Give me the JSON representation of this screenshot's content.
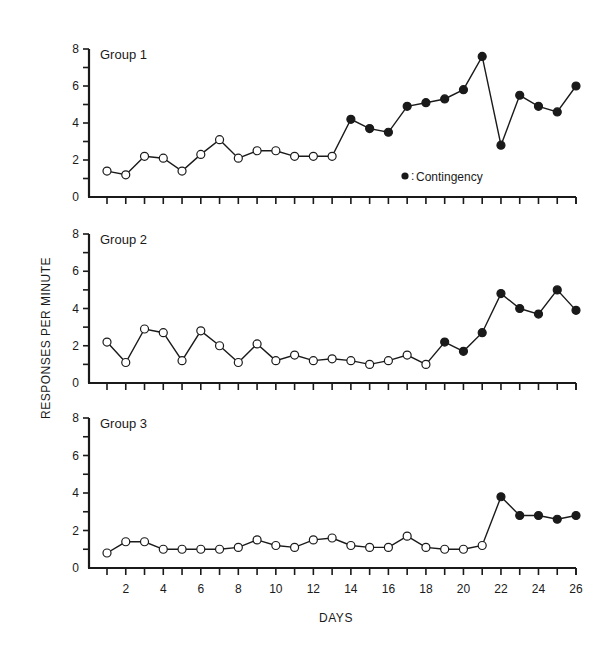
{
  "chart_data": {
    "type": "line",
    "title": "",
    "xlabel": "DAYS",
    "ylabel": "RESPONSES PER MINUTE",
    "x": [
      1,
      2,
      3,
      4,
      5,
      6,
      7,
      8,
      9,
      10,
      11,
      12,
      13,
      14,
      15,
      16,
      17,
      18,
      19,
      20,
      21,
      22,
      23,
      24,
      25,
      26
    ],
    "x_tick_labels": [
      "2",
      "4",
      "6",
      "8",
      "10",
      "12",
      "14",
      "16",
      "18",
      "20",
      "22",
      "24",
      "26"
    ],
    "x_tick_label_values": [
      2,
      4,
      6,
      8,
      10,
      12,
      14,
      16,
      18,
      20,
      22,
      24,
      26
    ],
    "ylim": [
      0,
      8
    ],
    "y_tick_labels": [
      "0",
      "2",
      "4",
      "6",
      "8"
    ],
    "y_tick_values": [
      0,
      2,
      4,
      6,
      8
    ],
    "grid": false,
    "legend": {
      "position": "inside-bottom-right of Group 1 panel",
      "entries": [
        {
          "marker": "filled-circle",
          "label": "= Contingency"
        }
      ],
      "label_text": "Contingency"
    },
    "panels": [
      {
        "name": "Group 1",
        "values": [
          1.4,
          1.2,
          2.2,
          2.1,
          1.4,
          2.3,
          3.1,
          2.1,
          2.5,
          2.5,
          2.2,
          2.2,
          2.2,
          4.2,
          3.7,
          3.5,
          4.9,
          5.1,
          5.3,
          5.8,
          7.6,
          2.8,
          5.5,
          4.9,
          4.6,
          6.0
        ],
        "contingency_start_day": 14
      },
      {
        "name": "Group 2",
        "values": [
          2.2,
          1.1,
          2.9,
          2.7,
          1.2,
          2.8,
          2.0,
          1.1,
          2.1,
          1.2,
          1.5,
          1.2,
          1.3,
          1.2,
          1.0,
          1.2,
          1.5,
          1.0,
          2.2,
          1.7,
          2.7,
          4.8,
          4.0,
          3.7,
          5.0,
          3.9
        ],
        "contingency_start_day": 19
      },
      {
        "name": "Group 3",
        "values": [
          0.8,
          1.4,
          1.4,
          1.0,
          1.0,
          1.0,
          1.0,
          1.1,
          1.5,
          1.2,
          1.1,
          1.5,
          1.6,
          1.2,
          1.1,
          1.1,
          1.7,
          1.1,
          1.0,
          1.0,
          1.2,
          3.8,
          2.8,
          2.8,
          2.6,
          2.8
        ],
        "contingency_start_day": 22
      }
    ],
    "marker_legend": {
      "open_circle": "no contingency (baseline)",
      "filled_circle": "Contingency"
    }
  },
  "colors": {
    "ink": "#1a1a1a",
    "background": "#ffffff",
    "open_marker_fill": "#ffffff"
  }
}
